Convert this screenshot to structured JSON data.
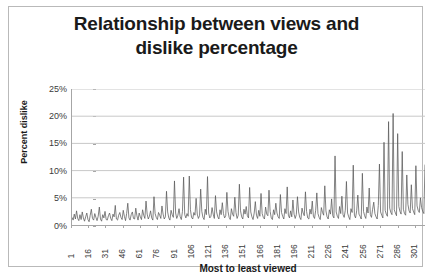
{
  "chart": {
    "title_line1": "Relationship between views and",
    "title_line2": "dislike percentage",
    "xlabel": "Most to least viewed",
    "ylabel": "Percent dislike"
  },
  "chart_data": {
    "type": "line",
    "title": "Relationship between views and dislike percentage",
    "xlabel": "Most to least viewed",
    "ylabel": "Percent dislike",
    "xlim": [
      1,
      310
    ],
    "ylim": [
      0,
      25
    ],
    "ytick_labels": [
      "0%",
      "5%",
      "10%",
      "15%",
      "20%",
      "25%"
    ],
    "ytick_values": [
      0,
      5,
      10,
      15,
      20,
      25
    ],
    "xtick_labels": [
      "1",
      "16",
      "31",
      "46",
      "61",
      "76",
      "91",
      "106",
      "121",
      "136",
      "151",
      "166",
      "181",
      "196",
      "211",
      "226",
      "241",
      "256",
      "271",
      "286",
      "301"
    ],
    "xtick_values": [
      1,
      16,
      31,
      46,
      61,
      76,
      91,
      106,
      121,
      136,
      151,
      166,
      181,
      196,
      211,
      226,
      241,
      256,
      271,
      286,
      301
    ],
    "grid": "horizontal",
    "legend": "none",
    "series_color": "#595959",
    "series": [
      {
        "name": "Percent dislike",
        "values": [
          1.4,
          0.9,
          2.0,
          1.1,
          2.6,
          1.2,
          0.8,
          1.9,
          1.0,
          2.4,
          1.3,
          0.7,
          1.5,
          2.2,
          1.0,
          0.6,
          1.8,
          2.9,
          1.2,
          0.9,
          2.1,
          1.4,
          0.8,
          1.6,
          3.3,
          1.1,
          0.7,
          1.9,
          1.3,
          2.5,
          1.0,
          0.9,
          1.7,
          2.2,
          1.2,
          0.8,
          2.0,
          1.5,
          3.6,
          1.1,
          0.9,
          1.8,
          2.3,
          1.4,
          1.0,
          2.7,
          1.6,
          0.8,
          2.1,
          4.0,
          1.3,
          0.9,
          1.9,
          2.4,
          1.2,
          1.1,
          3.1,
          1.7,
          0.9,
          2.2,
          1.5,
          1.0,
          2.8,
          1.8,
          1.2,
          4.4,
          2.0,
          1.1,
          1.6,
          2.6,
          1.3,
          0.9,
          5.2,
          2.1,
          1.4,
          1.0,
          2.3,
          1.8,
          1.2,
          3.5,
          2.0,
          1.1,
          1.5,
          6.2,
          2.4,
          1.3,
          0.9,
          2.7,
          1.9,
          1.4,
          8.1,
          2.2,
          1.2,
          1.8,
          3.0,
          1.5,
          1.0,
          2.5,
          8.8,
          1.9,
          1.3,
          2.1,
          1.6,
          9.0,
          2.8,
          1.4,
          1.1,
          2.3,
          1.8,
          4.9,
          2.0,
          1.2,
          1.7,
          6.6,
          2.5,
          1.4,
          1.0,
          2.9,
          1.9,
          8.9,
          2.2,
          1.3,
          1.6,
          3.2,
          2.0,
          1.2,
          5.4,
          2.4,
          1.5,
          1.1,
          2.8,
          1.9,
          4.1,
          2.1,
          1.3,
          1.7,
          6.0,
          2.5,
          1.4,
          1.0,
          3.0,
          2.0,
          1.6,
          5.1,
          2.3,
          1.2,
          1.8,
          7.5,
          2.6,
          1.5,
          1.1,
          2.9,
          2.0,
          3.4,
          1.7,
          1.3,
          6.9,
          2.4,
          1.5,
          1.0,
          2.2,
          4.3,
          1.8,
          1.2,
          2.7,
          1.6,
          5.8,
          2.1,
          1.4,
          1.1,
          3.3,
          2.0,
          1.7,
          6.4,
          2.5,
          1.3,
          1.0,
          2.8,
          1.9,
          4.0,
          2.2,
          1.5,
          1.2,
          5.6,
          2.3,
          1.6,
          1.1,
          3.0,
          2.1,
          7.0,
          1.8,
          1.3,
          2.6,
          1.5,
          4.6,
          2.0,
          1.2,
          1.9,
          5.2,
          2.4,
          1.4,
          1.0,
          3.1,
          2.2,
          1.7,
          6.1,
          2.5,
          1.3,
          1.1,
          2.9,
          2.0,
          4.4,
          1.6,
          1.2,
          2.7,
          5.9,
          2.1,
          1.4,
          1.0,
          3.2,
          2.3,
          1.8,
          7.2,
          2.6,
          1.5,
          1.1,
          2.8,
          2.0,
          4.8,
          1.7,
          1.3,
          12.7,
          2.4,
          1.6,
          1.2,
          3.4,
          2.1,
          5.3,
          1.9,
          1.4,
          2.7,
          8.0,
          2.2,
          1.5,
          1.0,
          3.0,
          2.3,
          11.0,
          1.8,
          1.3,
          2.6,
          5.5,
          2.0,
          1.6,
          1.1,
          9.5,
          2.5,
          1.7,
          1.2,
          3.3,
          2.2,
          6.8,
          1.9,
          1.4,
          2.9,
          4.2,
          2.1,
          1.5,
          1.1,
          3.6,
          11.2,
          2.4,
          1.8,
          1.3,
          15.2,
          2.7,
          2.0,
          1.6,
          19.0,
          3.1,
          2.3,
          1.9,
          20.5,
          2.8,
          2.2,
          1.7,
          16.8,
          3.4,
          2.5,
          2.0,
          13.5,
          2.9,
          2.1,
          1.8,
          9.2,
          3.8,
          2.6,
          2.2,
          7.4,
          3.0,
          2.4,
          1.9,
          10.9,
          3.5,
          2.7,
          2.3,
          5.0,
          3.2,
          2.5,
          2.1,
          11.1
        ]
      }
    ]
  }
}
